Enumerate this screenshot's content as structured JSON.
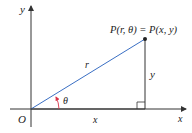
{
  "diagram": {
    "labels": {
      "y_axis": "y",
      "x_axis": "x",
      "origin": "O",
      "point": "P(r, θ) = P(x, y)",
      "radius": "r",
      "angle": "θ",
      "horizontal_leg": "x",
      "vertical_leg": "y"
    },
    "colors": {
      "radius_line": "#3a6fc4",
      "angle_arc": "#d9334a",
      "axes": "#333333"
    }
  }
}
